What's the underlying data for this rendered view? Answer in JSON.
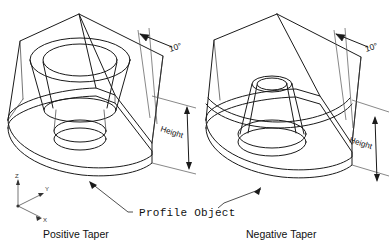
{
  "figure": {
    "title": "",
    "background_color": "#ffffff",
    "line_color": "#1a1a1a",
    "thin_line_color": "#555555"
  },
  "captions": {
    "left": "Positive Taper",
    "right": "Negative Taper"
  },
  "callout": {
    "label": "Profile Object",
    "has_left_leader": true,
    "has_right_leader": true
  },
  "axis_triad": {
    "origin_label": "",
    "z_label": "Z",
    "y_label": "Y",
    "x_label": "X"
  },
  "dimensions": {
    "angle_left": "10°",
    "angle_right": "10°",
    "height_left": "Height",
    "height_right": "Height"
  },
  "objects": [
    {
      "name": "positive-taper-solid",
      "caption": "Positive Taper",
      "taper_angle": "10°",
      "height_label": "Height",
      "description": "Extruded profile object with a circular hole, tapered inward toward the top"
    },
    {
      "name": "negative-taper-solid",
      "caption": "Negative Taper",
      "taper_angle": "10°",
      "height_label": "Height",
      "description": "Extruded profile object with a circular hole, tapered outward toward the top"
    }
  ]
}
